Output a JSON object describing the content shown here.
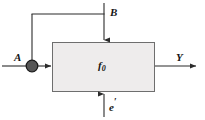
{
  "diagram": {
    "type": "block-diagram",
    "title": "",
    "background_color": "#ffffff",
    "line_color": "#2b2b2b",
    "block": {
      "label": "f",
      "label_subscript": "0",
      "fill_color": "#eeecec",
      "border_color": "#6e6e6e",
      "x": 52,
      "y": 42,
      "width": 103,
      "height": 50
    },
    "junction": {
      "name": "summing-junction",
      "shape": "filled-circle",
      "fill_color": "#555555",
      "border_color": "#1a1a1a",
      "cx": 32,
      "cy": 66,
      "r": 6
    },
    "signals": [
      {
        "id": "input-a",
        "label": "A",
        "direction": "right",
        "description": "primary input entering summing junction from the left"
      },
      {
        "id": "input-b",
        "label": "B",
        "direction": "down",
        "description": "top input feeding into the block and branching left to the summing junction"
      },
      {
        "id": "input-e-prime",
        "label": "e",
        "label_prime": "′",
        "direction": "up",
        "description": "bottom input entering the block from below"
      },
      {
        "id": "output-y",
        "label": "Y",
        "direction": "right",
        "description": "output leaving the block to the right"
      }
    ]
  }
}
